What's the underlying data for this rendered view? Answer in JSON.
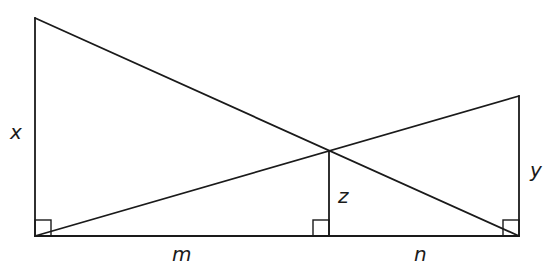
{
  "diagram": {
    "type": "geometry-two-poles-crossing-lines",
    "stroke_color": "#1a1a1a",
    "background": "#ffffff",
    "labels": {
      "x": "x",
      "y": "y",
      "z": "z",
      "m": "m",
      "n": "n"
    },
    "points": {
      "left_top": [
        35,
        18
      ],
      "left_bottom": [
        35,
        236
      ],
      "right_top": [
        519,
        96
      ],
      "right_bottom": [
        519,
        236
      ],
      "intersection": [
        329,
        151
      ],
      "foot_z": [
        329,
        236
      ]
    },
    "right_angles": [
      "left_bottom",
      "foot_z",
      "right_bottom"
    ],
    "segments": [
      {
        "name": "x",
        "from": "left_bottom",
        "to": "left_top"
      },
      {
        "name": "y",
        "from": "right_bottom",
        "to": "right_top"
      },
      {
        "name": "z",
        "from": "foot_z",
        "to": "intersection"
      },
      {
        "name": "m",
        "from": "left_bottom",
        "to": "foot_z"
      },
      {
        "name": "n",
        "from": "foot_z",
        "to": "right_bottom"
      },
      {
        "name": "diagonal-1",
        "from": "left_top",
        "to": "right_bottom"
      },
      {
        "name": "diagonal-2",
        "from": "left_bottom",
        "to": "right_top"
      }
    ]
  }
}
